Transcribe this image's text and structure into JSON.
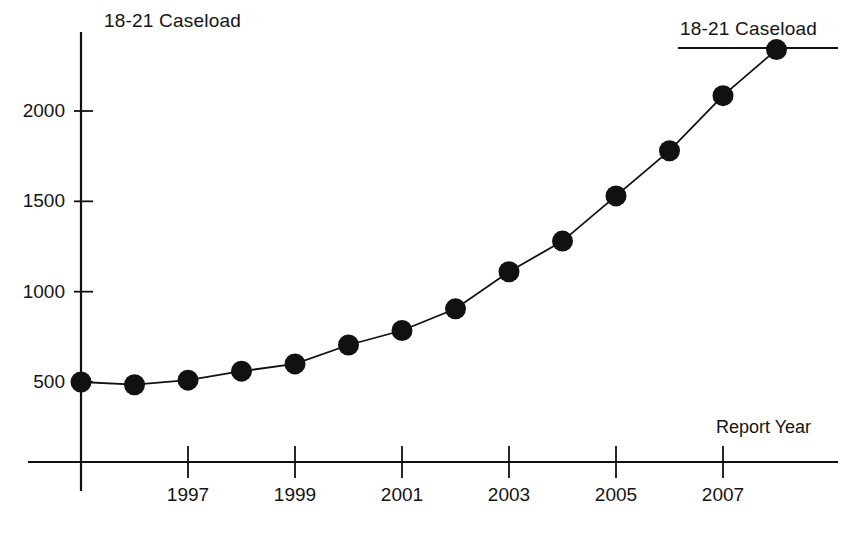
{
  "chart_data": {
    "type": "line",
    "title": "18-21 Caseload",
    "xlabel": "Report Year",
    "ylabel": "",
    "legend": [
      "18-21 Caseload"
    ],
    "legend_position": "top-right",
    "grid": false,
    "x": [
      1995,
      1996,
      1997,
      1998,
      1999,
      2000,
      2001,
      2002,
      2003,
      2004,
      2005,
      2006,
      2007,
      2008
    ],
    "values": [
      500,
      485,
      510,
      560,
      600,
      705,
      785,
      905,
      1110,
      1280,
      1530,
      1780,
      2085,
      2340
    ],
    "series": [
      {
        "name": "18-21 Caseload",
        "values": [
          500,
          485,
          510,
          560,
          600,
          705,
          785,
          905,
          1110,
          1280,
          1530,
          1780,
          2085,
          2340
        ]
      }
    ],
    "xlim": [
      1994.0,
      1995.0
    ],
    "ylim": [
      0,
      2500
    ],
    "xtick_labels": [
      "1997",
      "1999",
      "2001",
      "2003",
      "2005",
      "2007"
    ],
    "xtick_values": [
      1997,
      1999,
      2001,
      2003,
      2005,
      2007
    ],
    "ytick_labels": [
      "500",
      "1000",
      "1500",
      "2000"
    ],
    "ytick_values": [
      500,
      1000,
      1500,
      2000
    ],
    "marker": "filled-circle",
    "line_color": "#111111",
    "marker_color": "#111111"
  },
  "axis": {
    "x_title": "Report Year",
    "y_title": ""
  },
  "header": {
    "title": "18-21 Caseload"
  },
  "legend": {
    "entry_label": "18-21 Caseload"
  },
  "colors": {
    "ink": "#111111",
    "background": "#ffffff"
  }
}
